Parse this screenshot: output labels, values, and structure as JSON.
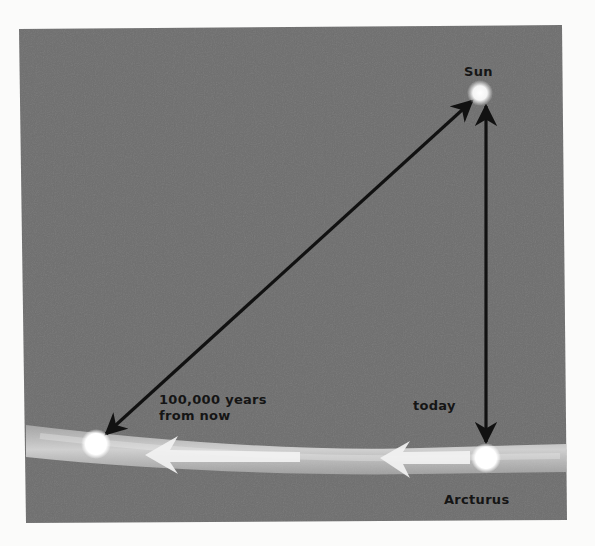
{
  "diagram": {
    "labels": {
      "sun": "Sun",
      "arcturus": "Arcturus",
      "today": "today",
      "future_line1": "100,000 years",
      "future_line2": "from now"
    },
    "colors": {
      "page_background": "#fbfbfa",
      "panel": "#6e6e6e",
      "star": "#ffffff",
      "arrow": "#111111",
      "streak": "#d9d9d9",
      "text": "#151515"
    },
    "objects": [
      {
        "name": "Sun",
        "role": "reference star"
      },
      {
        "name": "Arcturus",
        "role": "current position",
        "time": "today"
      },
      {
        "name": "Arcturus",
        "role": "future position",
        "time": "100,000 years from now"
      }
    ],
    "connections": [
      {
        "from": "Sun",
        "to": "Arcturus (today)",
        "type": "double-headed arrow"
      },
      {
        "from": "Sun",
        "to": "Arcturus (100,000 years from now)",
        "type": "double-headed arrow"
      }
    ],
    "motion": {
      "direction": "leftward",
      "arrow_count": 2
    }
  }
}
